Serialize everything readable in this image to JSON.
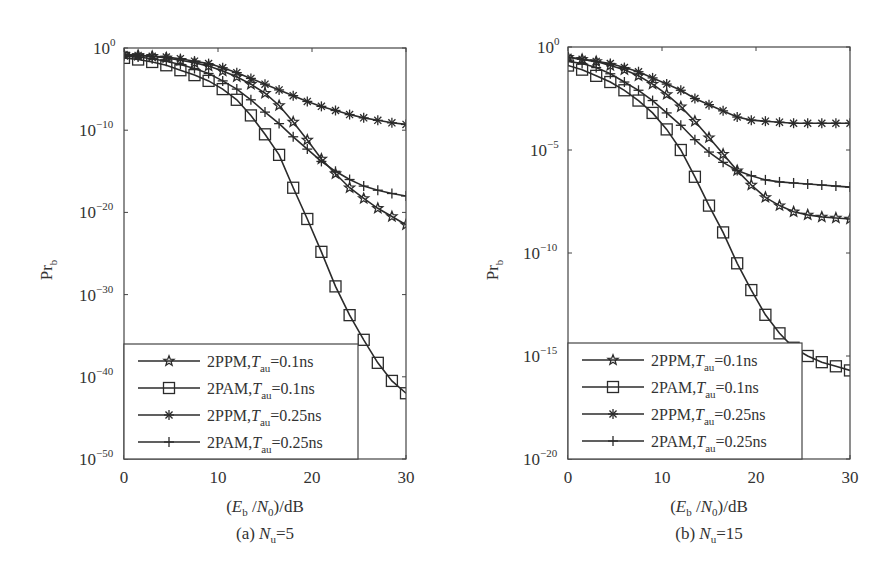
{
  "figure": {
    "panels": [
      {
        "id": "a",
        "caption_prefix": "(a)",
        "caption_var": "N",
        "caption_sub": "u",
        "caption_value": "=5"
      },
      {
        "id": "b",
        "caption_prefix": "(b)",
        "caption_var": "N",
        "caption_sub": "u",
        "caption_value": "=15"
      }
    ],
    "xlabel": "(Eb/N0)/dB",
    "ylabel": "Prb",
    "legend": [
      {
        "label": "2PPM,",
        "var": "T",
        "sub": "au",
        "value": "=0.1ns",
        "marker": "star"
      },
      {
        "label": "2PAM,",
        "var": "T",
        "sub": "au",
        "value": "=0.1ns",
        "marker": "square"
      },
      {
        "label": "2PPM,",
        "var": "T",
        "sub": "au",
        "value": "=0.25ns",
        "marker": "asterisk"
      },
      {
        "label": "2PAM,",
        "var": "T",
        "sub": "au",
        "value": "=0.25ns",
        "marker": "plus"
      }
    ],
    "line_color": "#2b2b2b"
  },
  "chart_data": [
    {
      "type": "line",
      "title": "(a) Nu=5",
      "xlabel": "(Eb/N0)/dB",
      "ylabel": "Prb",
      "yscale": "log",
      "xlim": [
        0,
        30
      ],
      "ylim_exponent": [
        -50,
        0
      ],
      "xticks": [
        0,
        10,
        20,
        30
      ],
      "yticks_exponent": [
        0,
        -10,
        -20,
        -30,
        -40,
        -50
      ],
      "grid": false,
      "legend_position": "lower left",
      "x": [
        0,
        1.5,
        3,
        4.5,
        6,
        7.5,
        9,
        10.5,
        12,
        13.5,
        15,
        16.5,
        18,
        19.5,
        21,
        22.5,
        24,
        25.5,
        27,
        28.5,
        30
      ],
      "series": [
        {
          "name": "2PPM, Tau=0.1ns",
          "marker": "star",
          "log10_values": [
            -0.8,
            -0.9,
            -1.0,
            -1.2,
            -1.5,
            -1.8,
            -2.2,
            -2.8,
            -3.5,
            -4.4,
            -5.5,
            -7.0,
            -9.0,
            -11.2,
            -13.5,
            -15.3,
            -17.0,
            -18.3,
            -19.5,
            -20.5,
            -21.5
          ]
        },
        {
          "name": "2PAM, Tau=0.1ns",
          "marker": "square",
          "log10_values": [
            -1.2,
            -1.4,
            -1.7,
            -2.1,
            -2.7,
            -3.3,
            -4.0,
            -5.0,
            -6.3,
            -8.2,
            -10.5,
            -13.0,
            -17.0,
            -20.8,
            -24.8,
            -29.0,
            -32.5,
            -35.5,
            -38.3,
            -40.5,
            -42.0
          ]
        },
        {
          "name": "2PPM, Tau=0.25ns",
          "marker": "asterisk",
          "log10_values": [
            -0.8,
            -0.9,
            -1.0,
            -1.1,
            -1.3,
            -1.6,
            -1.9,
            -2.4,
            -3.0,
            -3.7,
            -4.4,
            -5.1,
            -5.8,
            -6.5,
            -7.1,
            -7.6,
            -8.1,
            -8.5,
            -8.8,
            -9.1,
            -9.3
          ]
        },
        {
          "name": "2PAM, Tau=0.25ns",
          "marker": "plus",
          "log10_values": [
            -1.0,
            -1.1,
            -1.3,
            -1.6,
            -2.0,
            -2.5,
            -3.1,
            -4.0,
            -5.0,
            -6.3,
            -7.8,
            -9.2,
            -10.8,
            -12.3,
            -13.8,
            -15.0,
            -16.0,
            -16.8,
            -17.3,
            -17.7,
            -18.0
          ]
        }
      ]
    },
    {
      "type": "line",
      "title": "(b) Nu=15",
      "xlabel": "(Eb/N0)/dB",
      "ylabel": "Prb",
      "yscale": "log",
      "xlim": [
        0,
        30
      ],
      "ylim_exponent": [
        -20,
        0
      ],
      "xticks": [
        0,
        10,
        20,
        30
      ],
      "yticks_exponent": [
        0,
        -5,
        -10,
        -15,
        -20
      ],
      "grid": false,
      "legend_position": "lower left",
      "x": [
        0,
        1.5,
        3,
        4.5,
        6,
        7.5,
        9,
        10.5,
        12,
        13.5,
        15,
        16.5,
        18,
        19.5,
        21,
        22.5,
        24,
        25.5,
        27,
        28.5,
        30
      ],
      "series": [
        {
          "name": "2PPM, Tau=0.1ns",
          "marker": "star",
          "log10_values": [
            -0.5,
            -0.6,
            -0.7,
            -0.9,
            -1.1,
            -1.4,
            -1.8,
            -2.3,
            -2.9,
            -3.6,
            -4.4,
            -5.2,
            -6.0,
            -6.7,
            -7.3,
            -7.7,
            -8.0,
            -8.15,
            -8.25,
            -8.3,
            -8.35
          ]
        },
        {
          "name": "2PAM, Tau=0.1ns",
          "marker": "square",
          "log10_values": [
            -0.9,
            -1.1,
            -1.4,
            -1.7,
            -2.1,
            -2.6,
            -3.2,
            -4.0,
            -5.0,
            -6.3,
            -7.7,
            -9.0,
            -10.5,
            -11.8,
            -13.0,
            -13.9,
            -14.6,
            -15.0,
            -15.3,
            -15.5,
            -15.7
          ]
        },
        {
          "name": "2PPM, Tau=0.25ns",
          "marker": "asterisk",
          "log10_values": [
            -0.5,
            -0.6,
            -0.7,
            -0.8,
            -1.0,
            -1.2,
            -1.5,
            -1.8,
            -2.1,
            -2.5,
            -2.8,
            -3.1,
            -3.4,
            -3.55,
            -3.6,
            -3.65,
            -3.7,
            -3.7,
            -3.7,
            -3.7,
            -3.7
          ]
        },
        {
          "name": "2PAM, Tau=0.25ns",
          "marker": "plus",
          "log10_values": [
            -0.7,
            -0.8,
            -1.0,
            -1.3,
            -1.7,
            -2.1,
            -2.6,
            -3.2,
            -3.8,
            -4.5,
            -5.1,
            -5.6,
            -6.0,
            -6.25,
            -6.45,
            -6.55,
            -6.6,
            -6.65,
            -6.7,
            -6.75,
            -6.8
          ]
        }
      ]
    }
  ]
}
